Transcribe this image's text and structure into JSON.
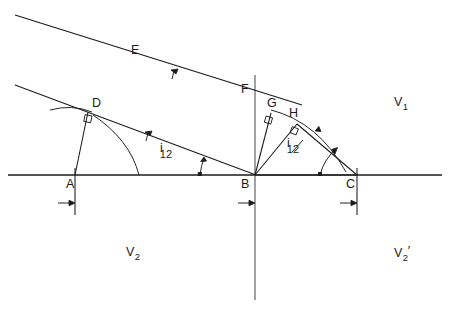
{
  "figure": {
    "type": "optics-refraction-wavefront-diagram",
    "background_color": "#ffffff",
    "line_color": "#1a1a1a",
    "width": 449,
    "height": 320
  },
  "labels": {
    "point_a": "A",
    "point_b": "B",
    "point_c": "C",
    "point_d": "D",
    "point_e": "E",
    "point_f": "F",
    "point_g": "G",
    "point_h": "H",
    "region_v1_base": "V",
    "region_v1_sub": "1",
    "region_v2_base": "V",
    "region_v2_sub": "2",
    "region_v2p_base": "V",
    "region_v2p_sub": "2",
    "region_v2p_prime": "′",
    "angle_left_base": "i",
    "angle_left_sub": "12",
    "angle_right_base": "i",
    "angle_right_sub": "12"
  },
  "geometry": {
    "baseline_y": 175,
    "baseline_x_start": 8,
    "baseline_x_end": 442,
    "point_a_x": 75,
    "point_b_x": 255,
    "point_c_x": 357,
    "point_d": [
      88,
      112
    ],
    "point_g": [
      270,
      113
    ],
    "point_h": [
      296,
      123
    ],
    "normal_line_x": 255,
    "normal_top_y": 75,
    "normal_bottom_y": 300,
    "ray_upper_start": [
      15,
      15
    ],
    "ray_upper_end": [
      300,
      104
    ],
    "ray_lower_start": [
      15,
      85
    ],
    "ray_lower_end": [
      255,
      175
    ],
    "incidence_angle_deg": 17.4
  }
}
